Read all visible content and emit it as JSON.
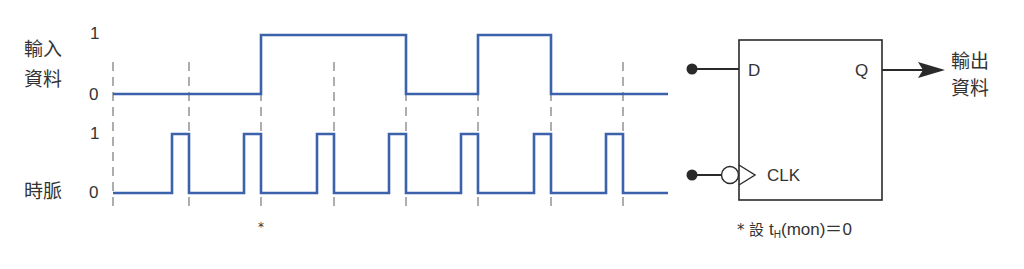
{
  "signals": {
    "data_input": {
      "label_line1": "輸入",
      "label_line2": "資料",
      "high_label": "1",
      "low_label": "0",
      "transitions": [
        {
          "x": 113,
          "level": 0
        },
        {
          "x": 261,
          "level": 1
        },
        {
          "x": 406,
          "level": 0
        },
        {
          "x": 478,
          "level": 1
        },
        {
          "x": 551,
          "level": 0
        },
        {
          "x": 668,
          "level": 0
        }
      ]
    },
    "clock": {
      "label": "時脈",
      "high_label": "1",
      "low_label": "0",
      "pulses": [
        {
          "rise": 172,
          "fall": 189
        },
        {
          "rise": 244,
          "fall": 261
        },
        {
          "rise": 317,
          "fall": 334
        },
        {
          "rise": 389,
          "fall": 406
        },
        {
          "rise": 461,
          "fall": 478
        },
        {
          "rise": 534,
          "fall": 551
        },
        {
          "rise": 606,
          "fall": 623
        }
      ]
    }
  },
  "dashed_markers_x": [
    113,
    189,
    261,
    334,
    406,
    478,
    551,
    623
  ],
  "asterisk_marker": {
    "x": 261,
    "text": "*"
  },
  "flip_flop": {
    "d_label": "D",
    "q_label": "Q",
    "clk_label": "CLK",
    "output_label_line1": "輸出",
    "output_label_line2": "資料",
    "note_prefix": "* 設 ",
    "note_t": "t",
    "note_sub": "H",
    "note_rest": "(mon)＝0"
  },
  "colors": {
    "waveform": "#3d62ac",
    "dashed": "#777777",
    "ink": "#2a2a2a"
  }
}
